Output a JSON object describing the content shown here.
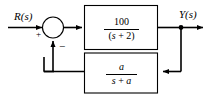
{
  "diagram": {
    "type": "control-system-block-diagram",
    "stroke_color": "#000000",
    "background_color": "#ffffff",
    "input_label": "R(s)",
    "output_label": "Y(s)",
    "summing_junction": {
      "name": "summing-junction",
      "positive_sign": "+",
      "negative_sign": "−"
    },
    "forward_block": {
      "name": "forward-path-block",
      "numerator": "100",
      "denominator_open": "(",
      "denominator_var": "s",
      "denominator_op": " + ",
      "denominator_const": "2",
      "denominator_close": ")",
      "transfer_function": "100/(s + 2)"
    },
    "feedback_block": {
      "name": "feedback-path-block",
      "numerator": "a",
      "denominator_var": "s",
      "denominator_op": " + ",
      "denominator_const": "a",
      "transfer_function": "a/(s + a)"
    }
  }
}
